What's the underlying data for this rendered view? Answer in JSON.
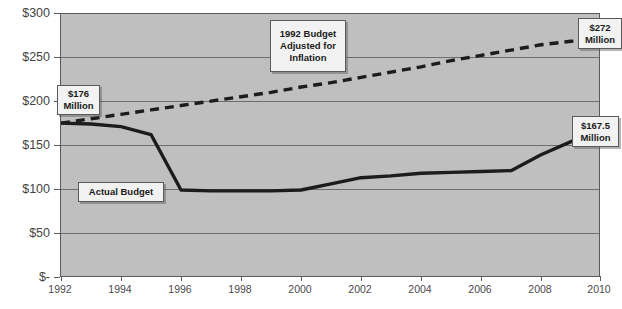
{
  "chart_data": {
    "type": "line",
    "title": "",
    "xlabel": "",
    "ylabel": "",
    "xlim": [
      1992,
      2010
    ],
    "ylim": [
      0,
      300
    ],
    "grid": true,
    "legend_position": "none",
    "y_ticks": [
      "$-",
      "$50",
      "$100",
      "$150",
      "$200",
      "$250",
      "$300"
    ],
    "y_tick_values": [
      0,
      50,
      100,
      150,
      200,
      250,
      300
    ],
    "x_ticks": [
      "1992",
      "1994",
      "1996",
      "1998",
      "2000",
      "2002",
      "2004",
      "2006",
      "2008",
      "2010"
    ],
    "x_tick_values": [
      1992,
      1994,
      1996,
      1998,
      2000,
      2002,
      2004,
      2006,
      2008,
      2010
    ],
    "x": [
      1992,
      1993,
      1994,
      1995,
      1996,
      1997,
      1998,
      1999,
      2000,
      2001,
      2002,
      2003,
      2004,
      2005,
      2006,
      2007,
      2008,
      2009,
      2010
    ],
    "series": [
      {
        "name": "Actual Budget",
        "style": "solid",
        "color": "#1c1c1c",
        "values": [
          176,
          175,
          172,
          163,
          100,
          99,
          99,
          99,
          100,
          107,
          114,
          116,
          119,
          120,
          121,
          122,
          140,
          155,
          167.5
        ]
      },
      {
        "name": "1992 Budget Adjusted for Inflation",
        "style": "dashed",
        "color": "#1c1c1c",
        "values": [
          176,
          181,
          186,
          191,
          196,
          201,
          206,
          211,
          217,
          222,
          228,
          234,
          240,
          247,
          253,
          259,
          265,
          269,
          272
        ]
      }
    ],
    "annotations": [
      {
        "id": "callout-176",
        "lines": [
          "$176",
          "Million"
        ],
        "value": 176,
        "year": 1992
      },
      {
        "id": "callout-actual",
        "lines": [
          "Actual Budget"
        ],
        "series": "Actual Budget"
      },
      {
        "id": "callout-inflation",
        "lines": [
          "1992 Budget",
          "Adjusted for",
          "Inflation"
        ],
        "series": "1992 Budget Adjusted for Inflation"
      },
      {
        "id": "callout-272",
        "lines": [
          "$272",
          "Million"
        ],
        "value": 272,
        "year": 2010
      },
      {
        "id": "callout-1675",
        "lines": [
          "$167.5",
          "Million"
        ],
        "value": 167.5,
        "year": 2010
      }
    ],
    "colors": {
      "plot_background": "#bfbfbf",
      "gridline": "#6e6e6e",
      "line": "#1c1c1c",
      "callout_background": "#f2f2f2",
      "callout_border": "#5a5a5a",
      "page_background": "#ffffff"
    }
  }
}
